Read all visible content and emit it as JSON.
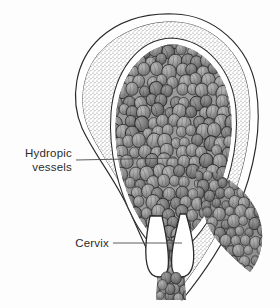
{
  "figure": {
    "background_color": "#fdfdfd",
    "ink_color": "#2b2b2b",
    "vesicle_fill": "#8a8a8a",
    "vesicle_outline": "#2e2e2e",
    "wall_stipple_color": "#6e6e6e",
    "leader_color": "#4a4a4a"
  },
  "labels": [
    {
      "name": "hydropic-vessels",
      "line1": "Hydropic",
      "line2": "vessels",
      "text_anchor_x": 72,
      "line1_y": 157,
      "line2_y": 171,
      "leader": {
        "x1": 76,
        "y1": 160,
        "x2": 176,
        "y2": 158
      }
    },
    {
      "name": "cervix",
      "line1": "Cervix",
      "line2": "",
      "text_anchor_x": 109,
      "line1_y": 247,
      "line2_y": 0,
      "leader": {
        "x1": 113,
        "y1": 243,
        "x2": 182,
        "y2": 243
      }
    }
  ],
  "structures": {
    "serosa_label": "outer uterine serosal contour",
    "myometrium_label": "stippled myometrial wall",
    "cavity_label": "uterine cavity filled with hydropic vesicles",
    "cervical_canal_label": "cervical canal with extruding vesicles",
    "external_os_label": "external os with protruding vesicle cluster",
    "cascade_label": "vesicle cascade spilling along right side"
  }
}
